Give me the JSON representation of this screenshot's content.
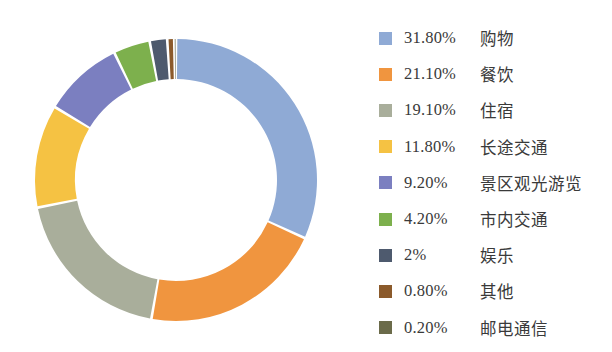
{
  "chart_data": {
    "type": "pie",
    "variant": "donut",
    "title": "",
    "subtitle": "",
    "xlabel": "",
    "ylabel": "",
    "grid": false,
    "legend_position": "right",
    "units": "percent",
    "start_angle_deg": 0,
    "direction": "clockwise",
    "inner_radius_ratio": 0.72,
    "categories": [
      "购物",
      "餐饮",
      "住宿",
      "长途交通",
      "景区观光游览",
      "市内交通",
      "娱乐",
      "其他",
      "邮电通信"
    ],
    "values": [
      31.8,
      21.1,
      19.1,
      11.8,
      9.2,
      4.2,
      2.0,
      0.8,
      0.2
    ],
    "value_labels": [
      "31.80%",
      "21.10%",
      "19.10%",
      "11.80%",
      "9.20%",
      "4.20%",
      "2%",
      "0.80%",
      "0.20%"
    ],
    "colors": [
      "#8FAAD5",
      "#F0953F",
      "#A9AE9B",
      "#F5C243",
      "#7B7FC0",
      "#7DB04D",
      "#4E5A6E",
      "#8B5A2B",
      "#6B6B4A"
    ]
  },
  "legend": {
    "items": [
      {
        "pct": "31.80%",
        "label": "购物",
        "color": "#8FAAD5"
      },
      {
        "pct": "21.10%",
        "label": "餐饮",
        "color": "#F0953F"
      },
      {
        "pct": "19.10%",
        "label": "住宿",
        "color": "#A9AE9B"
      },
      {
        "pct": "11.80%",
        "label": "长途交通",
        "color": "#F5C243"
      },
      {
        "pct": "9.20%",
        "label": "景区观光游览",
        "color": "#7B7FC0"
      },
      {
        "pct": "4.20%",
        "label": "市内交通",
        "color": "#7DB04D"
      },
      {
        "pct": "2%",
        "label": "娱乐",
        "color": "#4E5A6E"
      },
      {
        "pct": "0.80%",
        "label": "其他",
        "color": "#8B5A2B"
      },
      {
        "pct": "0.20%",
        "label": "邮电通信",
        "color": "#6B6B4A"
      }
    ]
  },
  "geometry": {
    "center_x": 176,
    "center_y": 180,
    "outer_radius": 141,
    "inner_radius": 101,
    "gap_deg": 1.1
  },
  "colors": {
    "background": "#FFFFFF",
    "text": "#3A3A3A",
    "slice_gap": "#FFFFFF"
  }
}
